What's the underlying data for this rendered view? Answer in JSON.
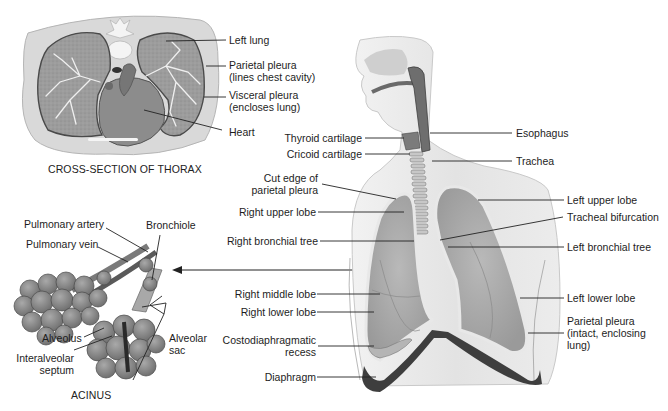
{
  "diagram": {
    "palette": {
      "ink": "#1d1d1d",
      "lung": "#a8a8a8",
      "lung_light": "#d4d4d4",
      "tissue": "#e6e6e6",
      "dark": "#4a4a4a",
      "leader": "#222222"
    }
  },
  "thorax": {
    "caption": "CROSS-SECTION OF THORAX",
    "labels": {
      "left_lung": "Left lung",
      "parietal_pleura_1": "Parietal pleura",
      "parietal_pleura_2": "(lines chest cavity)",
      "visceral_pleura_1": "Visceral pleura",
      "visceral_pleura_2": "(encloses lung)",
      "heart": "Heart"
    }
  },
  "acinus": {
    "caption": "ACINUS",
    "labels": {
      "pulmonary_artery": "Pulmonary artery",
      "pulmonary_vein": "Pulmonary vein",
      "bronchiole": "Bronchiole",
      "alveolus": "Alveolus",
      "interalveolar_1": "Interalveolar",
      "interalveolar_2": "septum",
      "alveolar_sac_1": "Alveolar",
      "alveolar_sac_2": "sac"
    }
  },
  "torso": {
    "left_side_labels": {
      "thyroid": "Thyroid cartilage",
      "cricoid": "Cricoid cartilage",
      "cut_edge_1": "Cut edge of",
      "cut_edge_2": "parietal pleura",
      "right_upper": "Right upper lobe",
      "right_bronchial": "Right bronchial tree",
      "right_middle": "Right middle lobe",
      "right_lower": "Right lower lobe",
      "costo_1": "Costodiaphragmatic",
      "costo_2": "recess",
      "diaphragm": "Diaphragm"
    },
    "right_side_labels": {
      "esophagus": "Esophagus",
      "trachea": "Trachea",
      "left_upper": "Left upper lobe",
      "tracheal_bifurcation": "Tracheal bifurcation",
      "left_bronchial": "Left bronchial tree",
      "left_lower": "Left lower lobe",
      "parietal_intact_1": "Parietal pleura",
      "parietal_intact_2": "(intact, enclosing",
      "parietal_intact_3": "lung)"
    }
  }
}
